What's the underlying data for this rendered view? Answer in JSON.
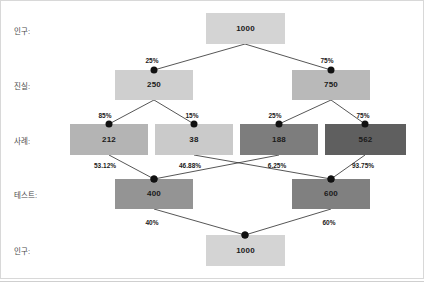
{
  "figure": {
    "title": "",
    "background_color": "#ffffff",
    "frame_color": "#d8d8d8",
    "width": 424,
    "height": 286
  },
  "row_labels": [
    {
      "id": "row-population-top",
      "text": "인구:",
      "x": 14,
      "y": 28
    },
    {
      "id": "row-truth",
      "text": "진실:",
      "x": 14,
      "y": 83
    },
    {
      "id": "row-case",
      "text": "사례:",
      "x": 14,
      "y": 138
    },
    {
      "id": "row-test",
      "text": "테스트:",
      "x": 14,
      "y": 192
    },
    {
      "id": "row-population-bottom",
      "text": "인구:",
      "x": 14,
      "y": 248
    }
  ],
  "chart_data": {
    "type": "diagram",
    "title": "",
    "subtype": "sankey-tree",
    "levels": [
      "인구:",
      "진실:",
      "사례:",
      "테스트:",
      "인구:"
    ],
    "nodes": [
      {
        "id": "pop-top",
        "level": 0,
        "label": "1000",
        "value": 1000,
        "color": "#d4d4d4",
        "text_color": "#1a1a1a",
        "x": 206,
        "y": 13,
        "w": 79,
        "h": 31
      },
      {
        "id": "truth-neg",
        "level": 1,
        "label": "250",
        "value": 250,
        "color": "#cfcfcf",
        "text_color": "#1a1a1a",
        "x": 115,
        "y": 70,
        "w": 78,
        "h": 30
      },
      {
        "id": "truth-pos",
        "level": 1,
        "label": "750",
        "value": 750,
        "color": "#b9b9b9",
        "text_color": "#1a1a1a",
        "x": 292,
        "y": 70,
        "w": 78,
        "h": 30
      },
      {
        "id": "case-212",
        "level": 2,
        "label": "212",
        "value": 212,
        "color": "#b4b4b4",
        "text_color": "#1a1a1a",
        "x": 70,
        "y": 124,
        "w": 78,
        "h": 31
      },
      {
        "id": "case-38",
        "level": 2,
        "label": "38",
        "value": 38,
        "color": "#cacaca",
        "text_color": "#1a1a1a",
        "x": 155,
        "y": 124,
        "w": 78,
        "h": 31
      },
      {
        "id": "case-188",
        "level": 2,
        "label": "188",
        "value": 188,
        "color": "#7d7d7d",
        "text_color": "#1a1a1a",
        "x": 240,
        "y": 124,
        "w": 78,
        "h": 31
      },
      {
        "id": "case-562",
        "level": 2,
        "label": "562",
        "value": 562,
        "color": "#5f5f5f",
        "text_color": "#1a1a1a",
        "x": 325,
        "y": 124,
        "w": 81,
        "h": 31
      },
      {
        "id": "test-400",
        "level": 3,
        "label": "400",
        "value": 400,
        "color": "#949494",
        "text_color": "#1a1a1a",
        "x": 115,
        "y": 179,
        "w": 78,
        "h": 30
      },
      {
        "id": "test-600",
        "level": 3,
        "label": "600",
        "value": 600,
        "color": "#808080",
        "text_color": "#1a1a1a",
        "x": 292,
        "y": 179,
        "w": 78,
        "h": 30
      },
      {
        "id": "pop-bottom",
        "level": 4,
        "label": "1000",
        "value": 1000,
        "color": "#d4d4d4",
        "text_color": "#1a1a1a",
        "x": 206,
        "y": 235,
        "w": 79,
        "h": 31
      }
    ],
    "links": [
      {
        "id": "link-pop-truth-neg",
        "from": "pop-top",
        "to": "truth-neg",
        "label": "25%",
        "value": 0.25,
        "x1": 245,
        "y1": 44,
        "x2": 154,
        "y2": 70,
        "lx": 152,
        "ly": 58
      },
      {
        "id": "link-pop-truth-pos",
        "from": "pop-top",
        "to": "truth-pos",
        "label": "75%",
        "value": 0.75,
        "x1": 245,
        "y1": 44,
        "x2": 331,
        "y2": 70,
        "lx": 327,
        "ly": 58
      },
      {
        "id": "link-truth-neg-case-212",
        "from": "truth-neg",
        "to": "case-212",
        "label": "85%",
        "value": 0.85,
        "x1": 154,
        "y1": 100,
        "x2": 109,
        "y2": 124,
        "lx": 105,
        "ly": 113
      },
      {
        "id": "link-truth-neg-case-38",
        "from": "truth-neg",
        "to": "case-38",
        "label": "15%",
        "value": 0.15,
        "x1": 154,
        "y1": 100,
        "x2": 194,
        "y2": 124,
        "lx": 192,
        "ly": 113
      },
      {
        "id": "link-truth-pos-case-188",
        "from": "truth-pos",
        "to": "case-188",
        "label": "25%",
        "value": 0.25,
        "x1": 331,
        "y1": 100,
        "x2": 279,
        "y2": 124,
        "lx": 275,
        "ly": 113
      },
      {
        "id": "link-truth-pos-case-562",
        "from": "truth-pos",
        "to": "case-562",
        "label": "75%",
        "value": 0.75,
        "x1": 331,
        "y1": 100,
        "x2": 365,
        "y2": 124,
        "lx": 363,
        "ly": 113
      },
      {
        "id": "link-case-212-test-400",
        "from": "case-212",
        "to": "test-400",
        "label": "53.12%",
        "value": 0.5312,
        "x1": 109,
        "y1": 155,
        "x2": 154,
        "y2": 179,
        "lx": 105,
        "ly": 163
      },
      {
        "id": "link-case-38-test-600",
        "from": "case-38",
        "to": "test-600",
        "label": "46.88%",
        "value": 0.4688,
        "x1": 194,
        "y1": 155,
        "x2": 331,
        "y2": 179,
        "lx": 190,
        "ly": 163
      },
      {
        "id": "link-case-188-test-400",
        "from": "case-188",
        "to": "test-400",
        "label": "6.25%",
        "value": 0.0625,
        "x1": 279,
        "y1": 155,
        "x2": 154,
        "y2": 179,
        "lx": 277,
        "ly": 163
      },
      {
        "id": "link-case-562-test-600",
        "from": "case-562",
        "to": "test-600",
        "label": "93.75%",
        "value": 0.9375,
        "x1": 365,
        "y1": 155,
        "x2": 331,
        "y2": 179,
        "lx": 363,
        "ly": 163
      },
      {
        "id": "link-test-400-pop",
        "from": "test-400",
        "to": "pop-bottom",
        "label": "40%",
        "value": 0.4,
        "x1": 154,
        "y1": 209,
        "x2": 245,
        "y2": 235,
        "lx": 152,
        "ly": 220
      },
      {
        "id": "link-test-600-pop",
        "from": "test-600",
        "to": "pop-bottom",
        "label": "60%",
        "value": 0.6,
        "x1": 331,
        "y1": 209,
        "x2": 245,
        "y2": 235,
        "lx": 329,
        "ly": 220
      }
    ]
  }
}
